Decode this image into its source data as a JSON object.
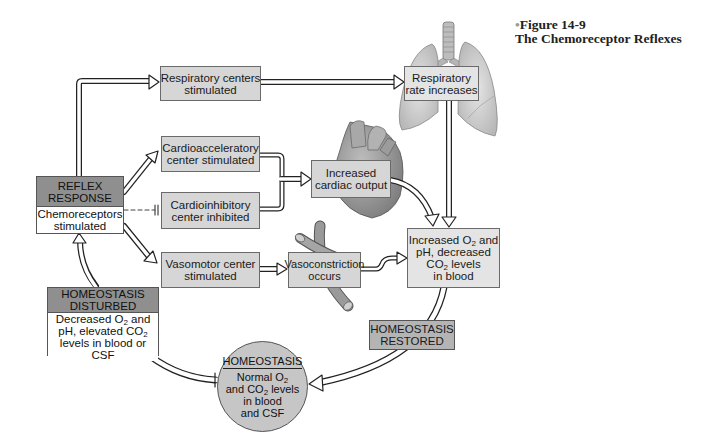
{
  "figure": {
    "label": "Figure 14-9",
    "title": "The Chemoreceptor Reflexes"
  },
  "nodes": {
    "reflex_response": {
      "header": [
        "REFLEX",
        "RESPONSE"
      ],
      "body": [
        "Chemoreceptors",
        "stimulated"
      ]
    },
    "respiratory_centers": [
      "Respiratory centers",
      "stimulated"
    ],
    "respiratory_rate": [
      "Respiratory",
      "rate increases"
    ],
    "cardioacceleratory": [
      "Cardioacceleratory",
      "center stimulated"
    ],
    "cardioinhibitory": [
      "Cardioinhibitory",
      "center inhibited"
    ],
    "cardiac_output": [
      "Increased",
      "cardiac output"
    ],
    "vasomotor": [
      "Vasomotor center",
      "stimulated"
    ],
    "vasoconstriction": [
      "Vasoconstriction",
      "occurs"
    ],
    "increased_o2": {
      "l1_pre": "Increased O",
      "l1_sub": "2",
      "l1_post": " and",
      "l2": "pH, decreased",
      "l3_pre": "CO",
      "l3_sub": "2",
      "l3_post": " levels",
      "l4": "in blood"
    },
    "homeostasis_disturbed": {
      "header": [
        "HOMEOSTASIS",
        "DISTURBED"
      ],
      "l1_pre": "Decreased O",
      "l1_sub": "2",
      "l1_post": " and",
      "l2_pre": "pH, elevated CO",
      "l2_sub": "2",
      "l3": "levels in blood or CSF"
    },
    "homeostasis_restored": [
      "HOMEOSTASIS",
      "RESTORED"
    ],
    "homeostasis": {
      "header": "HOMEOSTASIS",
      "l1_pre": "Normal O",
      "l1_sub": "2",
      "l2_pre": "and CO",
      "l2_sub": "2",
      "l2_post": " levels",
      "l3": "in blood",
      "l4": "and CSF"
    }
  },
  "illustrations": [
    "lungs",
    "heart",
    "blood-vessel"
  ],
  "colors": {
    "box_fill": "#d6d6d6",
    "header_fill": "#8f8f8f",
    "circle_fill": "#c6c6c6",
    "outline": "#1a1a1a"
  }
}
